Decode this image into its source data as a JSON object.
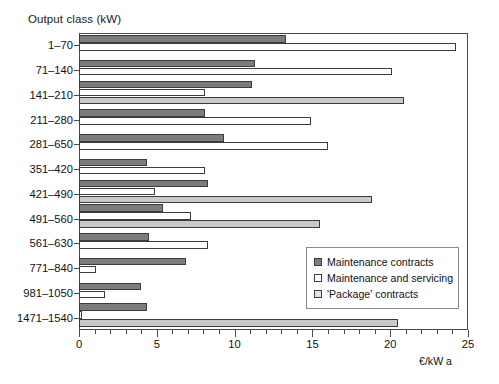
{
  "chart_data": {
    "type": "bar",
    "orientation": "horizontal",
    "title": "",
    "ylabel": "Output class (kW)",
    "xlabel": "€/kW a",
    "xlim": [
      0,
      25
    ],
    "xticks": [
      0,
      5,
      10,
      15,
      20,
      25
    ],
    "xtick_labels": [
      "0",
      "5",
      "10",
      "15",
      "20",
      "25"
    ],
    "minor_tick_step": 1,
    "grid": false,
    "legend_position": "center-right",
    "categories": [
      "1–70",
      "71–140",
      "141–210",
      "211–280",
      "281–650",
      "351–420",
      "421–490",
      "491–560",
      "561–630",
      "771–840",
      "981–1050",
      "1471–1540"
    ],
    "series": [
      {
        "name": "Maintenance contracts",
        "color": "#7c7c7c",
        "values": [
          13.3,
          11.3,
          11.1,
          8.1,
          9.3,
          4.4,
          8.3,
          5.4,
          4.5,
          6.9,
          4.0,
          4.4
        ]
      },
      {
        "name": "Maintenance and servicing",
        "color": "#ffffff",
        "values": [
          24.2,
          20.1,
          8.1,
          14.9,
          16.0,
          8.1,
          4.9,
          7.2,
          8.3,
          1.1,
          1.7,
          0.2
        ]
      },
      {
        "name": "'Package' contracts",
        "color": "#c9c9c9",
        "values": [
          null,
          null,
          20.9,
          null,
          null,
          null,
          18.8,
          15.5,
          null,
          null,
          null,
          20.5
        ]
      }
    ]
  },
  "legend": {
    "items": [
      {
        "label": "Maintenance contracts"
      },
      {
        "label": "Maintenance and servicing"
      },
      {
        "label": "'Package' contracts"
      }
    ]
  }
}
